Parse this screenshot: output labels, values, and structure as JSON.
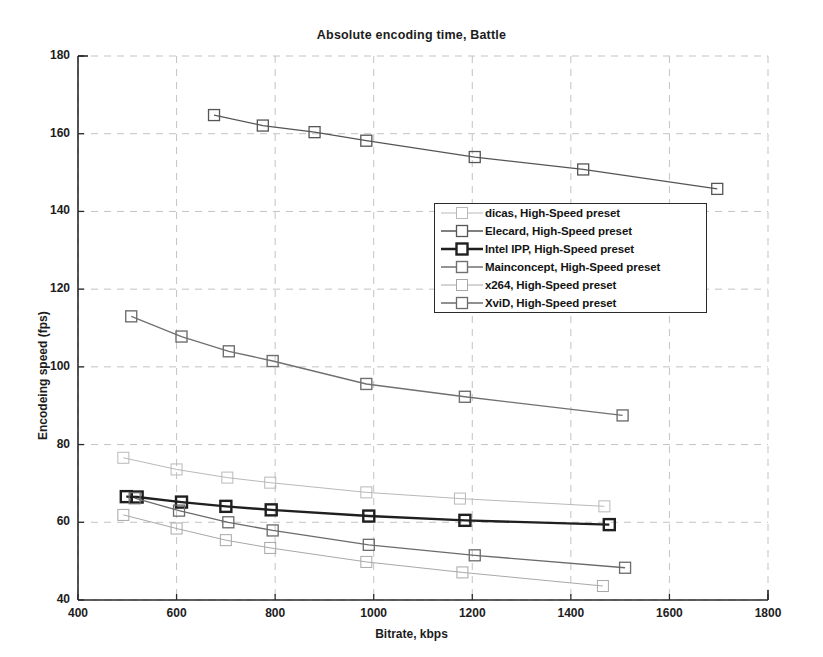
{
  "chart_data": {
    "type": "line",
    "title": "Absolute encoding time, Battle",
    "xlabel": "Bitrate, kbps",
    "ylabel": "Encodeing speed (fps)",
    "xlim": [
      400,
      1800
    ],
    "ylim": [
      40,
      180
    ],
    "xticks": [
      400,
      600,
      800,
      1000,
      1200,
      1400,
      1600,
      1800
    ],
    "yticks": [
      40,
      60,
      80,
      100,
      120,
      140,
      160,
      180
    ],
    "grid": true,
    "legend_position": "center",
    "marker": "square",
    "series": [
      {
        "name": "dicas, High-Speed preset",
        "color": "#b9b9b9",
        "linewidth": 1.0,
        "points": [
          {
            "x": 492,
            "y": 76.6
          },
          {
            "x": 600,
            "y": 73.6
          },
          {
            "x": 703,
            "y": 71.5
          },
          {
            "x": 790,
            "y": 70.2
          },
          {
            "x": 985,
            "y": 67.7
          },
          {
            "x": 1175,
            "y": 66.1
          },
          {
            "x": 1468,
            "y": 64.1
          }
        ]
      },
      {
        "name": "Elecard, High-Speed preset",
        "color": "#555555",
        "linewidth": 1.3,
        "points": [
          {
            "x": 676,
            "y": 164.8
          },
          {
            "x": 775,
            "y": 162.1
          },
          {
            "x": 880,
            "y": 160.4
          },
          {
            "x": 985,
            "y": 158.2
          },
          {
            "x": 1205,
            "y": 154.0
          },
          {
            "x": 1425,
            "y": 150.8
          },
          {
            "x": 1697,
            "y": 145.8
          }
        ]
      },
      {
        "name": "Intel IPP, High-Speed preset",
        "color": "#1f1f1f",
        "linewidth": 2.4,
        "points": [
          {
            "x": 498,
            "y": 66.6
          },
          {
            "x": 520,
            "y": 66.5
          },
          {
            "x": 610,
            "y": 65.2
          },
          {
            "x": 700,
            "y": 64.1
          },
          {
            "x": 792,
            "y": 63.2
          },
          {
            "x": 990,
            "y": 61.6
          },
          {
            "x": 1185,
            "y": 60.5
          },
          {
            "x": 1478,
            "y": 59.4
          }
        ]
      },
      {
        "name": "Mainconcept, High-Speed preset",
        "color": "#707070",
        "linewidth": 1.4,
        "points": [
          {
            "x": 508,
            "y": 113.0
          },
          {
            "x": 610,
            "y": 107.8
          },
          {
            "x": 706,
            "y": 104.0
          },
          {
            "x": 795,
            "y": 101.5
          },
          {
            "x": 985,
            "y": 95.6
          },
          {
            "x": 1185,
            "y": 92.3
          },
          {
            "x": 1505,
            "y": 87.5
          }
        ]
      },
      {
        "name": "x264, High-Speed preset",
        "color": "#a8a8a8",
        "linewidth": 1.0,
        "points": [
          {
            "x": 492,
            "y": 61.9
          },
          {
            "x": 600,
            "y": 58.4
          },
          {
            "x": 700,
            "y": 55.4
          },
          {
            "x": 790,
            "y": 53.4
          },
          {
            "x": 985,
            "y": 49.8
          },
          {
            "x": 1180,
            "y": 47.1
          },
          {
            "x": 1465,
            "y": 43.6
          }
        ]
      },
      {
        "name": "XviD, High-Speed preset",
        "color": "#6b6b6b",
        "linewidth": 1.3,
        "points": [
          {
            "x": 515,
            "y": 66.2
          },
          {
            "x": 605,
            "y": 63.0
          },
          {
            "x": 705,
            "y": 60.0
          },
          {
            "x": 795,
            "y": 57.9
          },
          {
            "x": 990,
            "y": 54.2
          },
          {
            "x": 1205,
            "y": 51.5
          },
          {
            "x": 1510,
            "y": 48.3
          }
        ]
      }
    ]
  },
  "legend": {
    "entries": [
      {
        "label": "dicas, High-Speed preset"
      },
      {
        "label": "Elecard, High-Speed preset"
      },
      {
        "label": "Intel IPP, High-Speed preset"
      },
      {
        "label": "Mainconcept, High-Speed preset"
      },
      {
        "label": "x264, High-Speed preset"
      },
      {
        "label": "XviD, High-Speed preset"
      }
    ]
  }
}
